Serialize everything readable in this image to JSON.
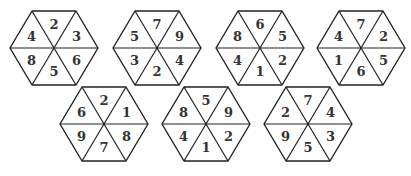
{
  "puzzle": {
    "description": "Seven hexagons, each divided into six triangles containing numbers",
    "segment_order": [
      "top",
      "upper-right",
      "lower-right",
      "bottom",
      "lower-left",
      "upper-left"
    ],
    "hexagons": [
      {
        "id": 1,
        "row": 1,
        "cx": 54,
        "cy": 48,
        "numbers": [
          "2",
          "3",
          "6",
          "5",
          "8",
          "4"
        ]
      },
      {
        "id": 2,
        "row": 1,
        "cx": 157,
        "cy": 48,
        "numbers": [
          "7",
          "9",
          "4",
          "2",
          "3",
          "5"
        ]
      },
      {
        "id": 3,
        "row": 1,
        "cx": 260,
        "cy": 48,
        "numbers": [
          "6",
          "5",
          "2",
          "1",
          "4",
          "8"
        ]
      },
      {
        "id": 4,
        "row": 1,
        "cx": 361,
        "cy": 48,
        "numbers": [
          "7",
          "2",
          "5",
          "6",
          "1",
          "4"
        ]
      },
      {
        "id": 5,
        "row": 2,
        "cx": 104,
        "cy": 124,
        "numbers": [
          "2",
          "1",
          "8",
          "7",
          "9",
          "6"
        ]
      },
      {
        "id": 6,
        "row": 2,
        "cx": 206,
        "cy": 124,
        "numbers": [
          "5",
          "9",
          "2",
          "1",
          "4",
          "8"
        ]
      },
      {
        "id": 7,
        "row": 2,
        "cx": 308,
        "cy": 124,
        "numbers": [
          "7",
          "4",
          "3",
          "5",
          "9",
          "2"
        ]
      }
    ],
    "colors": {
      "stroke": "#222222",
      "text": "#333333",
      "background": "#ffffff"
    }
  }
}
